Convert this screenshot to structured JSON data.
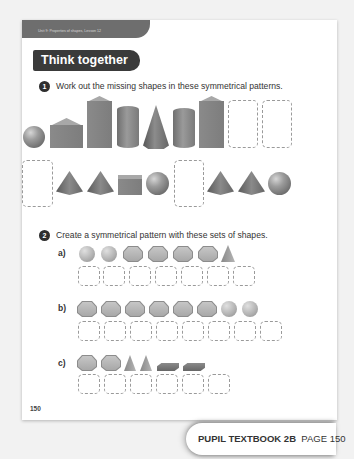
{
  "header": {
    "unit_label": "Unit 9: Properties of shapes, Lesson 12",
    "section_title": "Think together"
  },
  "question1": {
    "number": "1",
    "text": "Work out the missing shapes in these symmetrical patterns.",
    "row1": [
      "sphere",
      "cube",
      "tall-cuboid",
      "cylinder",
      "cone",
      "cylinder",
      "tall-cuboid",
      "blank",
      "blank"
    ],
    "row2": [
      "blank",
      "pyramid",
      "pyramid",
      "cube",
      "sphere",
      "blank",
      "pyramid",
      "pyramid",
      "sphere"
    ]
  },
  "question2": {
    "number": "2",
    "text": "Create a symmetrical pattern with these sets of shapes.",
    "parts": [
      {
        "label": "a)",
        "shapes": [
          "circle",
          "circle",
          "hexagon",
          "hexagon",
          "hexagon",
          "hexagon",
          "triangle"
        ],
        "blanks": 7
      },
      {
        "label": "b)",
        "shapes": [
          "hexagon",
          "hexagon",
          "hexagon",
          "hexagon",
          "hexagon",
          "hexagon",
          "circle",
          "circle"
        ],
        "blanks": 8
      },
      {
        "label": "c)",
        "shapes": [
          "hexagon",
          "hexagon",
          "triangle",
          "triangle",
          "flat-cuboid",
          "flat-cuboid"
        ],
        "blanks": 6
      }
    ]
  },
  "page_number": "150",
  "footer": {
    "book": "PUPIL TEXTBOOK 2B",
    "page": "PAGE 150"
  }
}
